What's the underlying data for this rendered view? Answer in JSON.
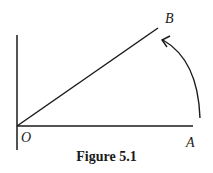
{
  "figure": {
    "caption": "Figure 5.1",
    "labels": {
      "origin": "O",
      "point_a": "A",
      "point_b": "B"
    },
    "colors": {
      "stroke": "#1a1a1a",
      "background": "#ffffff"
    }
  }
}
